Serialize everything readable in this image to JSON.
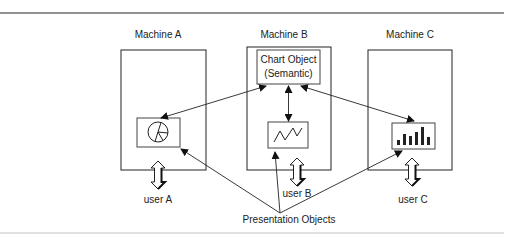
{
  "diagram": {
    "machines": [
      {
        "id": "A",
        "label": "Machine A",
        "user": "user A",
        "chart_icon": "pie-chart"
      },
      {
        "id": "B",
        "label": "Machine B",
        "user": "user B",
        "chart_icon": "line-chart"
      },
      {
        "id": "C",
        "label": "Machine C",
        "user": "user C",
        "chart_icon": "bar-chart"
      }
    ],
    "semantic_object": {
      "line1": "Chart Object",
      "line2": "(Semantic)"
    },
    "presentation_label": "Presentation Objects",
    "colors": {
      "stroke": "#222222",
      "rule": "#6e6e6e",
      "bottom_rule": "#bdbdbd"
    }
  }
}
